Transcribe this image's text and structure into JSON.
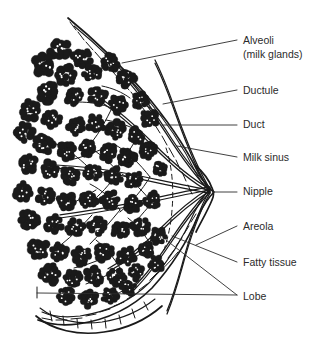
{
  "figure": {
    "background_color": "#ffffff",
    "ink_color": "#1a1a1a",
    "text_color": "#2b2b2b",
    "width": 325,
    "height": 337
  },
  "labels": [
    {
      "id": "alveoli",
      "lines": [
        "Alveoli",
        "(milk glands)"
      ],
      "text_x": 243,
      "text_y": 41,
      "leader": "M 122 63 L 237 40",
      "leader_type": "straight"
    },
    {
      "id": "ductule",
      "lines": [
        "Ductule"
      ],
      "text_x": 243,
      "text_y": 91,
      "leader": "M 163 104 L 237 90",
      "leader_type": "straight"
    },
    {
      "id": "duct",
      "lines": [
        "Duct"
      ],
      "text_x": 243,
      "text_y": 125,
      "leader": "M 162 125 L 237 125",
      "leader_type": "straight"
    },
    {
      "id": "milk-sinus",
      "lines": [
        "Milk sinus"
      ],
      "text_x": 243,
      "text_y": 158,
      "leader": "M 177 146 L 237 157",
      "leader_type": "straight"
    },
    {
      "id": "nipple",
      "lines": [
        "Nipple"
      ],
      "text_x": 243,
      "text_y": 192,
      "leader": "M 213 192 L 237 192",
      "leader_type": "straight"
    },
    {
      "id": "areola",
      "lines": [
        "Areola"
      ],
      "text_x": 243,
      "text_y": 227,
      "leader": "M 196 245 L 237 226",
      "leader_type": "straight"
    },
    {
      "id": "fatty-tissue",
      "lines": [
        "Fatty tissue"
      ],
      "text_x": 243,
      "text_y": 263,
      "leader": "M 172 236 L 237 262",
      "leader_type": "straight"
    },
    {
      "id": "lobe",
      "lines": [
        "Lobe"
      ],
      "text_x": 243,
      "text_y": 297,
      "leader": "M 37 293 L 237 295 M 166 240 L 237 295",
      "leader_type": "forked"
    }
  ],
  "anatomy": {
    "skin_outline": {
      "outer": "M 68 18 C 90 36 118 62 142 90 C 166 118 186 148 198 172 C 206 186 210 190 214 192 C 210 196 205 202 198 216 C 188 240 172 266 152 288 C 132 308 106 320 78 324 C 62 326 48 324 38 320",
      "inner": "M 74 26 C 95 43 121 68 144 95 C 167 122 185 150 196 173 C 202 184 206 188 209 190 C 205 194 201 200 194 213 C 184 236 169 261 150 282 C 131 301 107 312 80 316 C 64 318 51 316 42 312"
    },
    "skin_cells": [
      "M 70 22 L 76 30",
      "M 78 32 L 84 40",
      "M 86 42 L 93 50",
      "M 95 52 L 102 60",
      "M 104 62 L 111 70",
      "M 113 72 L 120 80",
      "M 122 82 L 129 90",
      "M 131 92 L 137 100",
      "M 139 103 L 145 111",
      "M 147 114 L 153 122",
      "M 155 125 L 160 133",
      "M 162 136 L 167 145",
      "M 169 148 L 174 157",
      "M 176 160 L 180 169",
      "M 182 172 L 186 181",
      "M 188 185 L 192 194",
      "M 196 214 L 191 222",
      "M 189 226 L 184 234",
      "M 182 238 L 176 246",
      "M 174 250 L 168 258",
      "M 166 262 L 159 269",
      "M 157 273 L 150 280",
      "M 147 284 L 139 290",
      "M 136 294 L 127 299",
      "M 124 302 L 114 306",
      "M 110 309 L 100 312",
      "M 96 314 L 86 316",
      "M 82 318 L 71 319",
      "M 67 320 L 56 320",
      "M 52 320 L 42 318"
    ],
    "nipple_outline": "M 196 166 C 203 172 209 180 212 188 C 214 192 214 196 212 200 C 208 210 201 222 196 232",
    "areola_dash": "M 166 148 C 172 166 174 188 172 210 C 171 224 168 238 164 250",
    "ducts": [
      {
        "path": "M 210 190 C 186 186 160 180 130 174 C 104 169 78 166 56 165",
        "w": 1.6
      },
      {
        "path": "M 210 190 C 186 194 160 200 132 206 C 106 211 82 215 60 218",
        "w": 1.6
      },
      {
        "path": "M 210 189 C 190 178 172 162 154 144 C 136 126 118 110 100 98",
        "w": 1.5
      },
      {
        "path": "M 210 191 C 192 202 176 216 160 232 C 144 248 126 262 108 272",
        "w": 1.5
      },
      {
        "path": "M 210 188 C 194 172 180 152 166 130 C 153 110 140 92 128 78",
        "w": 1.3
      },
      {
        "path": "M 210 192 C 195 208 182 226 170 244 C 158 262 146 278 134 290",
        "w": 1.3
      },
      {
        "path": "M 210 189 C 196 166 186 140 176 112 C 169 92 162 74 155 60",
        "w": 1.1
      },
      {
        "path": "M 210 193 C 197 216 189 242 182 268 C 177 286 172 302 167 314",
        "w": 1.1
      }
    ],
    "duct_branches": [
      "M 150 177 C 140 164 128 152 114 144",
      "M 150 177 C 142 190 132 202 120 212",
      "M 118 172 C 108 160 96 150 82 144",
      "M 118 172 C 110 184 100 196 88 204",
      "M 88 167 C 78 157 66 148 54 143",
      "M 152 203 C 142 214 132 226 122 238",
      "M 152 203 C 144 192 134 182 122 174",
      "M 120 210 C 110 222 100 234 90 244",
      "M 120 210 C 112 199 102 190 90 184",
      "M 92 215 C 82 226 72 236 62 244",
      "M 140 132 C 130 126 118 122 106 120",
      "M 140 132 C 134 144 126 156 118 166",
      "M 112 108 C 102 104 90 102 78 102",
      "M 112 108 C 106 120 100 132 92 142",
      "M 152 247 C 142 254 130 260 118 264",
      "M 152 247 C 146 236 138 226 128 218",
      "M 120 268 C 110 274 98 280 86 284",
      "M 120 268 C 114 258 106 248 96 240",
      "M 166 120 C 158 112 148 106 138 102",
      "M 178 252 C 170 262 160 272 150 280",
      "M 96 190 C 86 196 76 202 66 206",
      "M 100 150 C 90 154 80 158 70 160",
      "M 104 258 C 94 262 84 266 74 268",
      "M 130 98 C 122 92 112 88 102 86",
      "M 144 276 C 136 284 126 290 116 294"
    ],
    "alveoli_clusters": [
      {
        "x": 60,
        "y": 50,
        "r": 11
      },
      {
        "x": 82,
        "y": 58,
        "r": 10
      },
      {
        "x": 44,
        "y": 66,
        "r": 11
      },
      {
        "x": 66,
        "y": 76,
        "r": 10
      },
      {
        "x": 92,
        "y": 72,
        "r": 9
      },
      {
        "x": 110,
        "y": 62,
        "r": 9
      },
      {
        "x": 126,
        "y": 78,
        "r": 9
      },
      {
        "x": 48,
        "y": 92,
        "r": 11
      },
      {
        "x": 74,
        "y": 96,
        "r": 9
      },
      {
        "x": 98,
        "y": 96,
        "r": 9
      },
      {
        "x": 118,
        "y": 104,
        "r": 9
      },
      {
        "x": 140,
        "y": 100,
        "r": 8
      },
      {
        "x": 150,
        "y": 118,
        "r": 9
      },
      {
        "x": 30,
        "y": 110,
        "r": 10
      },
      {
        "x": 52,
        "y": 120,
        "r": 10
      },
      {
        "x": 76,
        "y": 126,
        "r": 9
      },
      {
        "x": 96,
        "y": 124,
        "r": 9
      },
      {
        "x": 116,
        "y": 130,
        "r": 9
      },
      {
        "x": 136,
        "y": 136,
        "r": 9
      },
      {
        "x": 24,
        "y": 132,
        "r": 10
      },
      {
        "x": 44,
        "y": 144,
        "r": 10
      },
      {
        "x": 66,
        "y": 150,
        "r": 9
      },
      {
        "x": 88,
        "y": 148,
        "r": 9
      },
      {
        "x": 108,
        "y": 152,
        "r": 9
      },
      {
        "x": 128,
        "y": 158,
        "r": 9
      },
      {
        "x": 148,
        "y": 150,
        "r": 8
      },
      {
        "x": 28,
        "y": 164,
        "r": 10
      },
      {
        "x": 50,
        "y": 170,
        "r": 9
      },
      {
        "x": 70,
        "y": 176,
        "r": 9
      },
      {
        "x": 92,
        "y": 172,
        "r": 9
      },
      {
        "x": 114,
        "y": 176,
        "r": 9
      },
      {
        "x": 134,
        "y": 180,
        "r": 9
      },
      {
        "x": 24,
        "y": 192,
        "r": 10
      },
      {
        "x": 46,
        "y": 196,
        "r": 9
      },
      {
        "x": 66,
        "y": 202,
        "r": 9
      },
      {
        "x": 88,
        "y": 200,
        "r": 9
      },
      {
        "x": 110,
        "y": 200,
        "r": 9
      },
      {
        "x": 132,
        "y": 204,
        "r": 9
      },
      {
        "x": 152,
        "y": 200,
        "r": 8
      },
      {
        "x": 30,
        "y": 220,
        "r": 10
      },
      {
        "x": 54,
        "y": 224,
        "r": 9
      },
      {
        "x": 76,
        "y": 228,
        "r": 9
      },
      {
        "x": 98,
        "y": 226,
        "r": 9
      },
      {
        "x": 120,
        "y": 230,
        "r": 9
      },
      {
        "x": 140,
        "y": 226,
        "r": 9
      },
      {
        "x": 158,
        "y": 236,
        "r": 8
      },
      {
        "x": 38,
        "y": 248,
        "r": 10
      },
      {
        "x": 60,
        "y": 252,
        "r": 9
      },
      {
        "x": 82,
        "y": 256,
        "r": 9
      },
      {
        "x": 104,
        "y": 252,
        "r": 9
      },
      {
        "x": 126,
        "y": 256,
        "r": 9
      },
      {
        "x": 146,
        "y": 250,
        "r": 8
      },
      {
        "x": 50,
        "y": 274,
        "r": 10
      },
      {
        "x": 72,
        "y": 278,
        "r": 9
      },
      {
        "x": 94,
        "y": 276,
        "r": 9
      },
      {
        "x": 116,
        "y": 278,
        "r": 9
      },
      {
        "x": 136,
        "y": 272,
        "r": 8
      },
      {
        "x": 66,
        "y": 296,
        "r": 9
      },
      {
        "x": 88,
        "y": 298,
        "r": 9
      },
      {
        "x": 110,
        "y": 296,
        "r": 8
      },
      {
        "x": 128,
        "y": 288,
        "r": 8
      },
      {
        "x": 160,
        "y": 168,
        "r": 8
      },
      {
        "x": 156,
        "y": 264,
        "r": 8
      }
    ],
    "chest_wall": {
      "outer": "M 36 316 C 52 330 78 336 104 332 C 126 329 146 320 162 306",
      "inner": "M 40 308 C 55 320 78 325 102 322 C 122 319 140 311 155 299",
      "cells": [
        "M 50 311 L 52 321",
        "M 63 316 L 64 325",
        "M 77 319 L 78 328",
        "M 91 320 L 92 329",
        "M 105 319 L 106 328",
        "M 119 315 L 121 324",
        "M 132 309 L 135 318",
        "M 144 302 L 148 310"
      ]
    },
    "lobe_markers": [
      "M 37 287 L 37 298"
    ]
  }
}
